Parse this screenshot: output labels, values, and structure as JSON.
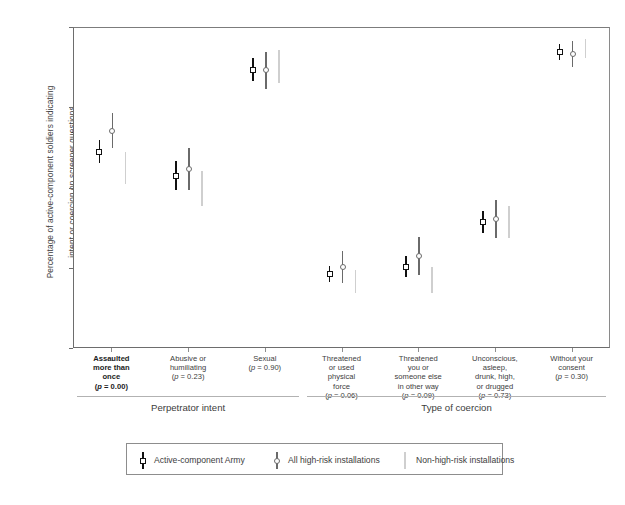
{
  "axes": {
    "ylabel_line1": "Percentage of active-component soldiers indicating",
    "ylabel_line2": "intent or coercion on screener questions",
    "yticks": [
      "0",
      "25",
      "50",
      "75",
      "100"
    ],
    "ymin": 0,
    "ymax": 100
  },
  "groups": {
    "perpetrator_intent": "Perpetrator intent",
    "type_of_coercion": "Type of coercion"
  },
  "legend": {
    "items": [
      {
        "label": "Active-component Army",
        "marker": "square",
        "color": "#111111"
      },
      {
        "label": "All high-risk installations",
        "marker": "circle",
        "color": "#6a6a6a"
      },
      {
        "label": "Non-high-risk installations",
        "marker": "none",
        "color": "#cfcfcf"
      }
    ]
  },
  "chart_data": {
    "type": "scatter",
    "title": "",
    "xlabel": "",
    "ylabel": "Percentage of active-component soldiers indicating intent or coercion on screener questions",
    "ylim": [
      0,
      100
    ],
    "yticks": [
      0,
      25,
      50,
      75,
      100
    ],
    "grid": false,
    "legend_position": "bottom",
    "error_bars": "95% confidence interval",
    "categories": [
      {
        "lines": [
          "Assaulted",
          "more than",
          "once"
        ],
        "pvalue": "(p = 0.00)",
        "bold": true,
        "group": "Perpetrator intent"
      },
      {
        "lines": [
          "Abusive or",
          "humiliating"
        ],
        "pvalue": "(p = 0.23)",
        "bold": false,
        "group": "Perpetrator intent"
      },
      {
        "lines": [
          "Sexual"
        ],
        "pvalue": "(p = 0.90)",
        "bold": false,
        "group": "Perpetrator intent"
      },
      {
        "lines": [
          "Threatened",
          "or used",
          "physical",
          "force"
        ],
        "pvalue": "(p = 0.06)",
        "bold": false,
        "group": "Type of coercion"
      },
      {
        "lines": [
          "Threatened",
          "you or",
          "someone else",
          "in other way"
        ],
        "pvalue": "(p = 0.09)",
        "bold": false,
        "group": "Type of coercion"
      },
      {
        "lines": [
          "Unconscious,",
          "asleep,",
          "drunk, high,",
          "or drugged"
        ],
        "pvalue": "(p = 0.73)",
        "bold": false,
        "group": "Type of coercion"
      },
      {
        "lines": [
          "Without your",
          "consent"
        ],
        "pvalue": "(p = 0.30)",
        "bold": false,
        "group": "Type of coercion"
      }
    ],
    "series": [
      {
        "name": "Active-component Army",
        "color": "#111111",
        "marker": "square",
        "values": [
          61.5,
          54.0,
          87.0,
          23.5,
          25.5,
          39.5,
          92.5
        ],
        "ci_low": [
          58.0,
          49.5,
          83.5,
          21.0,
          22.5,
          36.0,
          90.0
        ],
        "ci_high": [
          65.0,
          58.5,
          90.5,
          26.0,
          29.0,
          43.0,
          95.0
        ]
      },
      {
        "name": "All high-risk installations",
        "color": "#6a6a6a",
        "marker": "circle",
        "values": [
          68.0,
          56.0,
          87.0,
          25.5,
          29.0,
          40.5,
          92.0
        ],
        "ci_low": [
          62.5,
          49.5,
          81.0,
          20.5,
          23.0,
          34.5,
          88.0
        ],
        "ci_high": [
          73.5,
          62.5,
          92.5,
          30.5,
          35.0,
          46.5,
          96.0
        ]
      },
      {
        "name": "Non-high-risk installations",
        "color": "#cfcfcf",
        "marker": "none",
        "values": [
          56.5,
          50.0,
          88.0,
          21.0,
          21.5,
          39.5,
          93.5
        ],
        "ci_low": [
          51.5,
          44.5,
          83.0,
          17.5,
          17.5,
          34.5,
          90.5
        ],
        "ci_high": [
          61.5,
          55.5,
          93.0,
          24.5,
          25.5,
          44.5,
          96.5
        ]
      }
    ]
  }
}
